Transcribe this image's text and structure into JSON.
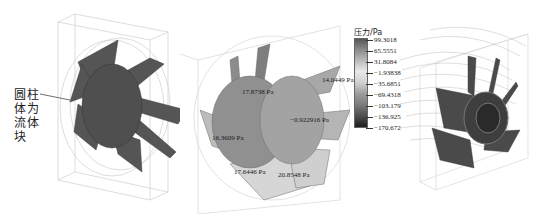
{
  "figure": {
    "annotation": {
      "lines": [
        "圆柱",
        "体为",
        "流体",
        "块"
      ],
      "text": "圆柱体为流体块"
    },
    "panels": [
      {
        "name": "fan-geometry-with-fluid-cylinder",
        "style": "solid dark gray fan blades inside wireframe box and cylinder"
      },
      {
        "name": "fan-surface-pressure-contour",
        "style": "grayscale pressure contour on fan blades with probe labels"
      },
      {
        "name": "fan-streamlines",
        "style": "streamlines around fan in wireframe box"
      }
    ],
    "pressure_labels": [
      {
        "id": "p1",
        "text": "17.8738 Pa"
      },
      {
        "id": "p2",
        "text": "14.0449 Pa"
      },
      {
        "id": "p3",
        "text": "−0.922916 Pa"
      },
      {
        "id": "p4",
        "text": "16.3609 Pa"
      },
      {
        "id": "p5",
        "text": "17.6446 Pa"
      },
      {
        "id": "p6",
        "text": "20.8548 Pa"
      }
    ],
    "colorbar": {
      "title": "压力/Pa",
      "ticks": [
        "99.3018",
        "65.5551",
        "31.8084",
        "−1.93838",
        "−35.6851",
        "−69.4318",
        "−103.179",
        "−136.925",
        "−170.672"
      ]
    }
  }
}
